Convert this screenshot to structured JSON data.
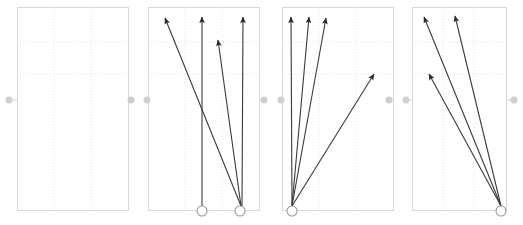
{
  "figure": {
    "title": "",
    "width": 523,
    "height": 225,
    "background_color": "#ffffff",
    "panel_count": 4,
    "connector_dot_color": "#cfcfcf",
    "grid_color": "#e9e2e2",
    "frame_color": "#d8d8d8",
    "arrow_color": "#2b2b2b",
    "origin_marker_color": "#9a9a9a"
  },
  "chart_data": {
    "type": "scatter",
    "title": "",
    "subtitle": "",
    "xlabel": "",
    "ylabel": "",
    "grid": true,
    "legend": null,
    "axis_y": 100,
    "panels": [
      {
        "index": 1,
        "label": "",
        "frame": {
          "x": 17,
          "y": 7,
          "width": 111,
          "height": 203
        },
        "grid_x": [
          54,
          91
        ],
        "grid_y": [
          42,
          74
        ],
        "origins": [],
        "arrows": [],
        "arrow_count": 0
      },
      {
        "index": 2,
        "label": "",
        "frame": {
          "x": 148,
          "y": 7,
          "width": 111,
          "height": 203
        },
        "grid_x": [
          185,
          222
        ],
        "grid_y": [
          42,
          74
        ],
        "origins": [
          {
            "x": 202,
            "y": 211,
            "r": 5
          },
          {
            "x": 240,
            "y": 211,
            "r": 5
          }
        ],
        "arrows": [
          {
            "x1": 241,
            "y1": 206,
            "x2": 165,
            "y2": 18
          },
          {
            "x1": 202,
            "y1": 206,
            "x2": 202,
            "y2": 17
          },
          {
            "x1": 241,
            "y1": 206,
            "x2": 218,
            "y2": 40
          },
          {
            "x1": 242,
            "y1": 206,
            "x2": 243,
            "y2": 17
          }
        ],
        "arrow_count": 4
      },
      {
        "index": 3,
        "label": "",
        "frame": {
          "x": 282,
          "y": 7,
          "width": 111,
          "height": 203
        },
        "grid_x": [
          319,
          356
        ],
        "grid_y": [
          42,
          74
        ],
        "origins": [
          {
            "x": 292,
            "y": 211,
            "r": 5
          }
        ],
        "arrows": [
          {
            "x1": 292,
            "y1": 206,
            "x2": 291,
            "y2": 17
          },
          {
            "x1": 292,
            "y1": 206,
            "x2": 309,
            "y2": 17
          },
          {
            "x1": 292,
            "y1": 206,
            "x2": 326,
            "y2": 18
          },
          {
            "x1": 292,
            "y1": 206,
            "x2": 374,
            "y2": 74
          }
        ],
        "arrow_count": 4
      },
      {
        "index": 4,
        "label": "",
        "frame": {
          "x": 412,
          "y": 7,
          "width": 94,
          "height": 203
        },
        "grid_x": [
          443,
          474
        ],
        "grid_y": [
          42,
          74
        ],
        "origins": [
          {
            "x": 501,
            "y": 211,
            "r": 5
          }
        ],
        "arrows": [
          {
            "x1": 501,
            "y1": 206,
            "x2": 424,
            "y2": 17
          },
          {
            "x1": 501,
            "y1": 206,
            "x2": 455,
            "y2": 16
          },
          {
            "x1": 501,
            "y1": 206,
            "x2": 429,
            "y2": 74
          }
        ],
        "arrow_count": 3
      }
    ],
    "connector_dots": [
      {
        "x": 9,
        "y": 100,
        "r": 3.5
      },
      {
        "x": 131,
        "y": 100,
        "r": 3.5
      },
      {
        "x": 147,
        "y": 100,
        "r": 3.5
      },
      {
        "x": 264,
        "y": 100,
        "r": 3.5
      },
      {
        "x": 281,
        "y": 100,
        "r": 3.5
      },
      {
        "x": 389,
        "y": 100,
        "r": 3.5
      },
      {
        "x": 406,
        "y": 100,
        "r": 3.5
      },
      {
        "x": 514,
        "y": 100,
        "r": 3.5
      }
    ],
    "axis_segments": [
      {
        "x1": 9,
        "x2": 131,
        "y": 100
      },
      {
        "x1": 147,
        "x2": 264,
        "y": 100
      },
      {
        "x1": 281,
        "x2": 389,
        "y": 100
      },
      {
        "x1": 406,
        "x2": 514,
        "y": 100
      }
    ]
  }
}
